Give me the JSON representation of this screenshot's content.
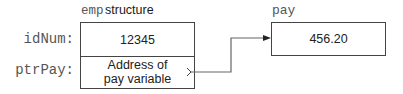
{
  "struct": {
    "name_mono": "emp",
    "name_suffix": "structure",
    "fields": [
      {
        "label": "idNum:",
        "value": "12345"
      },
      {
        "label": "ptrPay:",
        "value_line1": "Address of",
        "value_line2": "pay variable"
      }
    ]
  },
  "target": {
    "name": "pay",
    "value": "456.20"
  },
  "colors": {
    "line": "#444444",
    "mono_text": "#555555"
  }
}
